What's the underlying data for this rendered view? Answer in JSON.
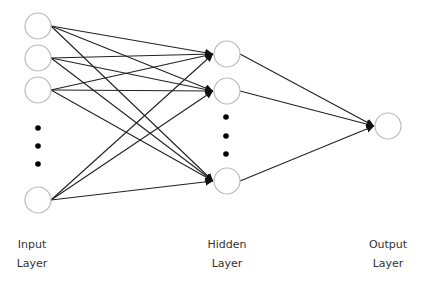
{
  "diagram": {
    "type": "feedforward-neural-network",
    "colors": {
      "background": "#ffffff",
      "node_stroke": "#bbbbbb",
      "node_fill": "#ffffff",
      "edge": "#222222",
      "ellipsis_dot": "#000000",
      "label_text": "#333333"
    },
    "node_radius": 13,
    "layers": [
      {
        "id": "input",
        "label_line1": "Input",
        "label_line2": "Layer",
        "label_x": 32,
        "nodes": [
          {
            "x": 38,
            "y": 26
          },
          {
            "x": 38,
            "y": 58
          },
          {
            "x": 38,
            "y": 90
          },
          {
            "x": 38,
            "y": 200
          }
        ],
        "ellipsis": {
          "x": 38,
          "ys": [
            128,
            146,
            164
          ]
        }
      },
      {
        "id": "hidden",
        "label_line1": "Hidden",
        "label_line2": "Layer",
        "label_x": 227,
        "nodes": [
          {
            "x": 227,
            "y": 54
          },
          {
            "x": 227,
            "y": 91
          },
          {
            "x": 227,
            "y": 181
          }
        ],
        "ellipsis": {
          "x": 226,
          "ys": [
            117,
            136,
            154
          ]
        }
      },
      {
        "id": "output",
        "label_line1": "Output",
        "label_line2": "Layer",
        "label_x": 388,
        "nodes": [
          {
            "x": 388,
            "y": 126
          }
        ],
        "ellipsis": null
      }
    ],
    "connections": "fully-connected input→hidden, hidden→output, arrowheads at target, line hops at crossings"
  }
}
